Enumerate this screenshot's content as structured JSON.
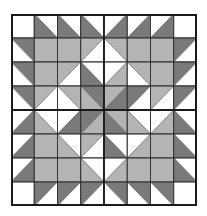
{
  "quilt": {
    "rows": 8,
    "cols": 8,
    "colors": {
      "W": "#ffffff",
      "L": "#b4b4b4",
      "D": "#7a7a7a"
    },
    "legend": "cell = [diagonal, colorA, colorB]; diagonal '\\\\' = TL-BR (A=upper-right, B=lower-left); '/' = BL-TR (A=upper-left, B=lower-right); 'F' = full (A)",
    "cells": [
      [
        [
          "F",
          "W"
        ],
        [
          "\\",
          "W",
          "D"
        ],
        [
          "\\",
          "W",
          "D"
        ],
        [
          "\\",
          "W",
          "D"
        ],
        [
          "/",
          "W",
          "D"
        ],
        [
          "/",
          "W",
          "D"
        ],
        [
          "/",
          "W",
          "D"
        ],
        [
          "F",
          "W"
        ]
      ],
      [
        [
          "\\",
          "D",
          "W"
        ],
        [
          "F",
          "L"
        ],
        [
          "F",
          "L"
        ],
        [
          "/",
          "L",
          "W"
        ],
        [
          "\\",
          "L",
          "W"
        ],
        [
          "F",
          "L"
        ],
        [
          "F",
          "L"
        ],
        [
          "/",
          "D",
          "W"
        ]
      ],
      [
        [
          "\\",
          "D",
          "W"
        ],
        [
          "F",
          "L"
        ],
        [
          "/",
          "L",
          "W"
        ],
        [
          "\\",
          "W",
          "D"
        ],
        [
          "/",
          "W",
          "L"
        ],
        [
          "\\",
          "L",
          "W"
        ],
        [
          "F",
          "L"
        ],
        [
          "/",
          "D",
          "W"
        ]
      ],
      [
        [
          "\\",
          "D",
          "W"
        ],
        [
          "/",
          "L",
          "W"
        ],
        [
          "\\",
          "L",
          "W"
        ],
        [
          "\\",
          "D",
          "L"
        ],
        [
          "/",
          "L",
          "D"
        ],
        [
          "/",
          "D",
          "W"
        ],
        [
          "/",
          "L",
          "W"
        ],
        [
          "/",
          "D",
          "W"
        ]
      ],
      [
        [
          "/",
          "W",
          "D"
        ],
        [
          "\\",
          "W",
          "L"
        ],
        [
          "/",
          "W",
          "D"
        ],
        [
          "/",
          "D",
          "L"
        ],
        [
          "\\",
          "L",
          "D"
        ],
        [
          "\\",
          "W",
          "L"
        ],
        [
          "/",
          "W",
          "L"
        ],
        [
          "\\",
          "W",
          "D"
        ]
      ],
      [
        [
          "/",
          "W",
          "D"
        ],
        [
          "F",
          "L"
        ],
        [
          "\\",
          "W",
          "L"
        ],
        [
          "/",
          "L",
          "W"
        ],
        [
          "\\",
          "W",
          "D"
        ],
        [
          "/",
          "W",
          "L"
        ],
        [
          "F",
          "L"
        ],
        [
          "\\",
          "W",
          "D"
        ]
      ],
      [
        [
          "/",
          "W",
          "D"
        ],
        [
          "F",
          "L"
        ],
        [
          "F",
          "L"
        ],
        [
          "\\",
          "W",
          "L"
        ],
        [
          "/",
          "W",
          "L"
        ],
        [
          "F",
          "L"
        ],
        [
          "F",
          "L"
        ],
        [
          "\\",
          "W",
          "D"
        ]
      ],
      [
        [
          "F",
          "W"
        ],
        [
          "/",
          "D",
          "W"
        ],
        [
          "/",
          "D",
          "W"
        ],
        [
          "/",
          "D",
          "W"
        ],
        [
          "\\",
          "D",
          "W"
        ],
        [
          "\\",
          "D",
          "W"
        ],
        [
          "\\",
          "D",
          "W"
        ],
        [
          "F",
          "W"
        ]
      ]
    ]
  }
}
